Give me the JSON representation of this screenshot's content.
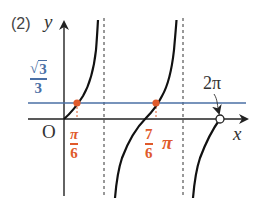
{
  "problem_label": "(2)",
  "axes": {
    "x_label": "x",
    "y_label": "y",
    "origin_label": "O"
  },
  "horizontal_line": {
    "label_numerator": "3",
    "label_denominator": "3",
    "label_text": "√3/3",
    "color": "#4a6fa5"
  },
  "intersections": [
    {
      "numerator": "π",
      "denominator": "6",
      "suffix": "",
      "label_text": "π/6",
      "color": "#e05a2b"
    },
    {
      "numerator": "7",
      "denominator": "6",
      "suffix": "π",
      "label_text": "7/6 π",
      "color": "#e05a2b"
    }
  ],
  "endpoint": {
    "label": "2π",
    "style": "open-circle"
  },
  "asymptotes": [
    "π/2",
    "3π/2"
  ],
  "function": "y = tan x, 0 ≤ x < 2π",
  "colors": {
    "curve": "#111111",
    "axis": "#222222",
    "line": "#4a6fa5",
    "highlight": "#e05a2b"
  }
}
